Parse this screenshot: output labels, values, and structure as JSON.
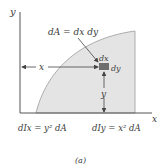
{
  "figure": {
    "caption": "(a)",
    "axis_x_label": "x",
    "axis_y_label": "y",
    "element_label": "dA = dx dy",
    "dx_label": "dx",
    "dy_label": "dy",
    "x_distance_label": "x",
    "y_distance_label": "y",
    "formula_ix": "dIx = y² dA",
    "formula_iy": "dIy = x² dA",
    "colors": {
      "region_fill": "#e4e4e4",
      "region_stroke": "#9a9a9a",
      "element_fill": "#6e6e6e",
      "axis": "#555555",
      "text": "#3a3a3a"
    }
  }
}
